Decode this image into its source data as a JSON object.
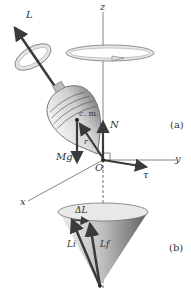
{
  "diagram": {
    "panel_a": {
      "label": "(a)",
      "axes": {
        "z": "z",
        "y": "y",
        "x": "x",
        "origin": "O"
      },
      "vectors": {
        "angular_momentum": "L",
        "normal_force": "N",
        "weight": "Mg",
        "position": "r",
        "torque": "τ"
      },
      "center_of_mass": "c. m."
    },
    "panel_b": {
      "label": "(b)",
      "vectors": {
        "initial": "Li",
        "final": "Lf",
        "change": "ΔL"
      }
    },
    "colors": {
      "vector": "#3a3a3a",
      "axis": "#555555",
      "surface_light": "#eeeeee",
      "surface_dark": "#777777"
    }
  }
}
